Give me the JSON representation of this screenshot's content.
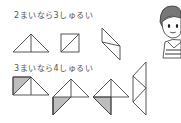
{
  "section1": {
    "caption": "2まいなら3しゅるい",
    "shape_count": 3
  },
  "section2": {
    "caption": "3まいなら4しゅるい",
    "shape_count": 4
  },
  "colors": {
    "line": "#444444",
    "shade": "#bdbdbd",
    "text": "#555555"
  },
  "character": {
    "description": "boy-illustration"
  }
}
